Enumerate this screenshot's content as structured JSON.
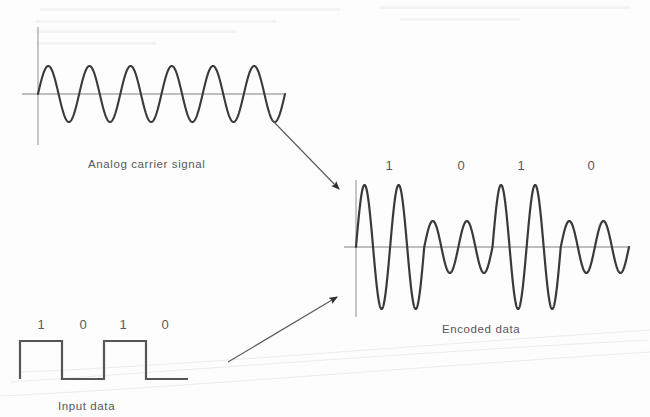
{
  "figure": {
    "background_color": "#fdfdfd",
    "ink_color": "#3a3a3c",
    "axis_color": "#a9a9ad",
    "text_color": "#57575a"
  },
  "panels": {
    "analog_carrier": {
      "caption": "Analog carrier signal",
      "cycles": 6,
      "axis_y": 94,
      "axis_x": 38,
      "axis_x_end": 285,
      "amplitude": 28
    },
    "encoded_data": {
      "caption": "Encoded data",
      "bit_labels": [
        "1",
        "0",
        "1",
        "0"
      ],
      "axis_y": 247,
      "axis_x": 356,
      "axis_x_end": 629,
      "high_amplitude": 62,
      "low_amplitude": 26,
      "cycles_per_bit": 2
    },
    "input_data": {
      "caption": "Input data",
      "bit_labels": [
        "1",
        "0",
        "1",
        "0"
      ],
      "bits": [
        1,
        0,
        1,
        0
      ],
      "high_y": 341,
      "low_y": 379,
      "start_x": 20,
      "end_x": 188
    }
  },
  "arrows": [
    {
      "name": "carrier-to-encoder",
      "x1": 272,
      "y1": 120,
      "x2": 340,
      "y2": 190
    },
    {
      "name": "input-to-encoder",
      "x1": 228,
      "y1": 362,
      "x2": 338,
      "y2": 296
    }
  ],
  "chart_data": {
    "type": "line",
    "subplots": [
      {
        "name": "Analog carrier signal",
        "caption": "Analog carrier signal",
        "type": "line",
        "waveform": "sine",
        "cycles": 6,
        "amplitude": 1.0,
        "phase": 0,
        "xlabel": "",
        "ylabel": "",
        "grid": false
      },
      {
        "name": "Input data",
        "caption": "Input data",
        "type": "line",
        "waveform": "square",
        "categories": [
          "1",
          "0",
          "1",
          "0"
        ],
        "values": [
          1,
          0,
          1,
          0
        ],
        "ylim": [
          0,
          1
        ],
        "xlabel": "",
        "ylabel": "",
        "grid": false
      },
      {
        "name": "Encoded data",
        "caption": "Encoded data",
        "type": "line",
        "waveform": "amplitude-shift-keyed sine",
        "categories": [
          "1",
          "0",
          "1",
          "0"
        ],
        "series": [
          {
            "name": "amplitude envelope",
            "values": [
              1.0,
              0.42,
              1.0,
              0.42
            ]
          }
        ],
        "cycles_per_symbol": 2,
        "total_cycles": 8,
        "xlabel": "",
        "ylabel": "",
        "grid": false
      }
    ],
    "legend": [],
    "annotations": [
      "Analog carrier signal",
      "Input data",
      "Encoded data",
      "1",
      "0",
      "1",
      "0"
    ]
  }
}
